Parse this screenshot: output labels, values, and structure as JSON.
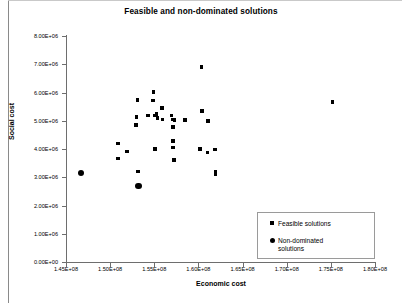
{
  "chart_data": {
    "type": "scatter",
    "title": "Feasible and non-dominated solutions",
    "xlabel": "Economic cost",
    "ylabel": "Social cost",
    "xlim": [
      145000000,
      180000000
    ],
    "ylim": [
      0,
      8000000
    ],
    "grid": false,
    "legend_position": "lower-right",
    "xticks": [
      145000000,
      150000000,
      155000000,
      160000000,
      165000000,
      170000000,
      175000000,
      180000000
    ],
    "xticklabels": [
      "1.45E+08",
      "1.50E+08",
      "1.55E+08",
      "1.60E+08",
      "1.65E+08",
      "1.70E+08",
      "1.75E+08",
      "1.80E+08"
    ],
    "yticks": [
      0,
      1000000,
      2000000,
      3000000,
      4000000,
      5000000,
      6000000,
      7000000,
      8000000
    ],
    "yticklabels": [
      "0.00E+00",
      "1.00E+06",
      "2.00E+06",
      "3.00E+06",
      "4.00E+06",
      "5.00E+06",
      "6.00E+06",
      "7.00E+06",
      "8.00E+06"
    ],
    "series": [
      {
        "name": "Feasible solutions",
        "marker": "square",
        "color": "#000000",
        "points": [
          [
            150900000,
            4200000
          ],
          [
            150900000,
            3670000
          ],
          [
            151900000,
            3910000
          ],
          [
            153100000,
            5740000
          ],
          [
            153000000,
            5140000
          ],
          [
            152900000,
            4850000
          ],
          [
            153150000,
            3210000
          ],
          [
            154300000,
            5190000
          ],
          [
            154900000,
            6020000
          ],
          [
            154850000,
            5710000
          ],
          [
            155250000,
            5230000
          ],
          [
            155100000,
            5190000
          ],
          [
            155350000,
            5100000
          ],
          [
            155100000,
            4010000
          ],
          [
            155900000,
            5450000
          ],
          [
            155950000,
            5040000
          ],
          [
            156950000,
            5180000
          ],
          [
            157050000,
            5050000
          ],
          [
            157300000,
            5020000
          ],
          [
            157150000,
            4780000
          ],
          [
            157100000,
            4290000
          ],
          [
            157100000,
            4050000
          ],
          [
            157200000,
            3620000
          ],
          [
            158500000,
            5020000
          ],
          [
            160400000,
            5350000
          ],
          [
            160350000,
            6900000
          ],
          [
            161100000,
            4990000
          ],
          [
            160200000,
            4010000
          ],
          [
            161050000,
            3880000
          ],
          [
            161900000,
            3980000
          ],
          [
            161950000,
            3180000
          ],
          [
            161950000,
            3100000
          ],
          [
            175200000,
            5670000
          ]
        ]
      },
      {
        "name": "Non-dominated solutions",
        "marker": "circle",
        "color": "#000000",
        "points": [
          [
            146700000,
            3150000
          ],
          [
            153200000,
            2690000
          ]
        ]
      }
    ]
  },
  "legend": {
    "entries": [
      {
        "label": "Feasible solutions",
        "marker": "square"
      },
      {
        "label": "Non-dominated\nsolutions",
        "marker": "circle"
      }
    ]
  }
}
